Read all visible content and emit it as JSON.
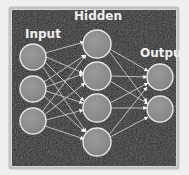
{
  "figure": {
    "type": "diagram",
    "width": 189,
    "height": 175,
    "background_color": "#151515",
    "frame_color": "#b9b9b9",
    "node_fill_color": "#8c8c8c",
    "node_stroke_color": "#e8e8e8",
    "edge_color": "#c9c9c9",
    "arrow_color": "#ffffff",
    "label_color": "#f0f0f0"
  },
  "labels": {
    "input": "Input",
    "hidden": "Hidden",
    "output": "Output"
  },
  "label_positions": {
    "input": {
      "x": 25,
      "y": 38
    },
    "hidden": {
      "x": 74,
      "y": 20
    },
    "output": {
      "x": 140,
      "y": 57
    }
  },
  "label_font_size": 12,
  "layers": [
    {
      "name": "input",
      "label": "Input",
      "node_count": 3,
      "radius": 13,
      "nodes": [
        {
          "id": "i1",
          "cx": 33,
          "cy": 57
        },
        {
          "id": "i2",
          "cx": 33,
          "cy": 89
        },
        {
          "id": "i3",
          "cx": 33,
          "cy": 121
        }
      ]
    },
    {
      "name": "hidden",
      "label": "Hidden",
      "node_count": 4,
      "radius": 14,
      "nodes": [
        {
          "id": "h1",
          "cx": 97,
          "cy": 44
        },
        {
          "id": "h2",
          "cx": 97,
          "cy": 76
        },
        {
          "id": "h3",
          "cx": 97,
          "cy": 108
        },
        {
          "id": "h4",
          "cx": 97,
          "cy": 142
        }
      ]
    },
    {
      "name": "output",
      "label": "Output",
      "node_count": 2,
      "radius": 13,
      "nodes": [
        {
          "id": "o1",
          "cx": 160,
          "cy": 77
        },
        {
          "id": "o2",
          "cx": 160,
          "cy": 109
        }
      ]
    }
  ],
  "edges": {
    "input_to_hidden_count": 12,
    "hidden_to_output_count": 8,
    "total": 20,
    "directed": true,
    "arrowhead_shape": "triangle"
  }
}
